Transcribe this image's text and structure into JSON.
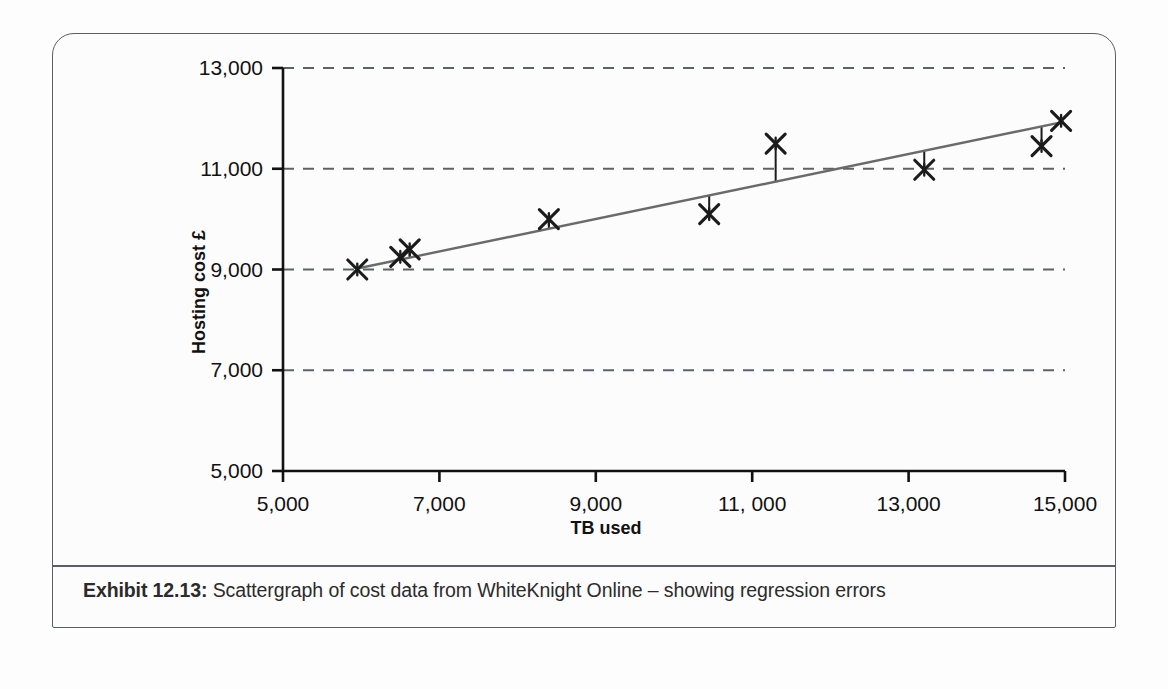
{
  "exhibit": {
    "caption_label": "Exhibit 12.13:",
    "caption_text": "Scattergraph of cost data from WhiteKnight Online – showing regression errors"
  },
  "chart_data": {
    "type": "scatter",
    "title": "",
    "xlabel": "TB used",
    "ylabel": "Hosting cost £",
    "xlim": [
      5000,
      15000
    ],
    "ylim": [
      5000,
      13000
    ],
    "xticks": [
      5000,
      7000,
      9000,
      11000,
      13000,
      15000
    ],
    "xtick_labels": [
      "5,000",
      "7,000",
      "9,000",
      "11, 000",
      "13,000",
      "15,000"
    ],
    "yticks": [
      5000,
      7000,
      9000,
      11000,
      13000
    ],
    "ytick_labels": [
      "5,000",
      "7,000",
      "9,000",
      "11,000",
      "13,000"
    ],
    "grid": "horizontal-dashed",
    "grid_values": [
      7000,
      9000,
      11000,
      13000
    ],
    "legend": "none",
    "marker": "x-star",
    "marker_color": "#1b1b1b",
    "series": [
      {
        "name": "Observed cost",
        "points": [
          {
            "x": 5950,
            "y": 9000
          },
          {
            "x": 6500,
            "y": 9250
          },
          {
            "x": 6620,
            "y": 9400
          },
          {
            "x": 8400,
            "y": 10000
          },
          {
            "x": 10450,
            "y": 10100
          },
          {
            "x": 11300,
            "y": 11500
          },
          {
            "x": 13200,
            "y": 10980
          },
          {
            "x": 14700,
            "y": 11450
          },
          {
            "x": 14950,
            "y": 11950
          }
        ]
      }
    ],
    "regression_line": {
      "name": "Regression line",
      "color": "#6a6a6a",
      "x_start": 5950,
      "y_start": 9020,
      "x_end": 14980,
      "y_end": 11930
    },
    "residuals": [
      {
        "x": 6500,
        "y_point": 9250,
        "y_fit": 9200
      },
      {
        "x": 6620,
        "y_point": 9400,
        "y_fit": 9240
      },
      {
        "x": 8400,
        "y_point": 10000,
        "y_fit": 9810
      },
      {
        "x": 10450,
        "y_point": 10100,
        "y_fit": 10470
      },
      {
        "x": 11300,
        "y_point": 11500,
        "y_fit": 10745
      },
      {
        "x": 13200,
        "y_point": 10980,
        "y_fit": 11360
      },
      {
        "x": 14700,
        "y_point": 11450,
        "y_fit": 11840
      },
      {
        "x": 14950,
        "y_point": 11950,
        "y_fit": 11920
      }
    ]
  }
}
